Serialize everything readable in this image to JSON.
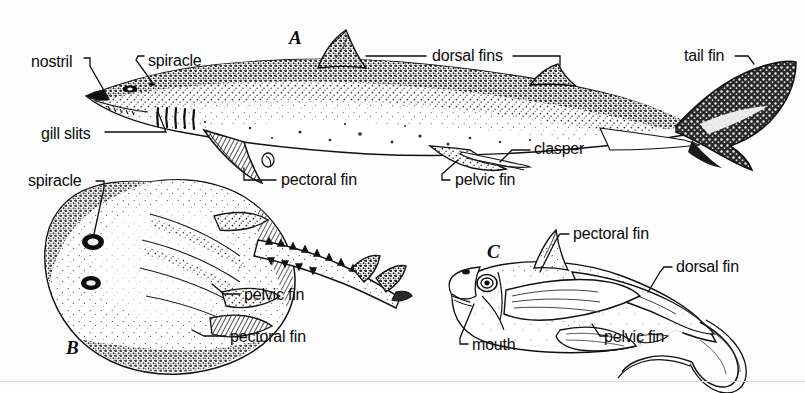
{
  "plate": {
    "title": "Cartilaginous fishes comparative anatomy plate",
    "background_color": "#fdfdfd",
    "ink_color": "#0b0b0b",
    "width": 805,
    "height": 393
  },
  "figures": [
    {
      "key": "A",
      "letter": "A",
      "subject": "shark (spiny dogfish), lateral view",
      "x": 295,
      "y": 38
    },
    {
      "key": "B",
      "letter": "B",
      "subject": "skate, dorsal view",
      "x": 72,
      "y": 348
    },
    {
      "key": "C",
      "letter": "C",
      "subject": "chimaera (ratfish), lateral view",
      "x": 493,
      "y": 252
    }
  ],
  "labels": {
    "shark": [
      {
        "id": "nostril",
        "text": "nostril",
        "x": 31,
        "y": 62
      },
      {
        "id": "spiracle",
        "text": "spiracle",
        "x": 148,
        "y": 61
      },
      {
        "id": "gill-slits",
        "text": "gill slits",
        "x": 41,
        "y": 136
      },
      {
        "id": "dorsal-fins",
        "text": "dorsal fins",
        "x": 432,
        "y": 60
      },
      {
        "id": "tail-fin",
        "text": "tail fin",
        "x": 684,
        "y": 59
      },
      {
        "id": "clasper",
        "text": "clasper",
        "x": 534,
        "y": 150
      },
      {
        "id": "pelvic-fin",
        "text": "pelvic fin",
        "x": 455,
        "y": 184
      },
      {
        "id": "pectoral-fin",
        "text": "pectoral fin",
        "x": 281,
        "y": 183
      }
    ],
    "skate": [
      {
        "id": "spiracle",
        "text": "spiracle",
        "x": 28,
        "y": 186
      },
      {
        "id": "pelvic-fin",
        "text": "pelvic fin",
        "x": 244,
        "y": 298
      },
      {
        "id": "pectoral-fin",
        "text": "pectoral fin",
        "x": 230,
        "y": 340
      }
    ],
    "chimaera": [
      {
        "id": "pectoral-fin",
        "text": "pectoral fin",
        "x": 573,
        "y": 238
      },
      {
        "id": "dorsal-fin",
        "text": "dorsal fin",
        "x": 676,
        "y": 271
      },
      {
        "id": "pelvic-fin",
        "text": "pelvic fin",
        "x": 604,
        "y": 340
      },
      {
        "id": "mouth",
        "text": "mouth",
        "x": 472,
        "y": 348
      }
    ]
  }
}
